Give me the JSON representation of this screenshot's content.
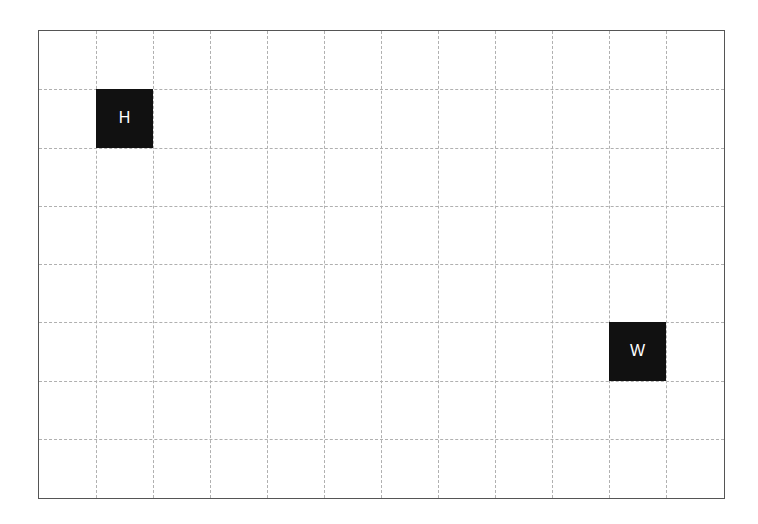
{
  "grid": {
    "columns": 12,
    "rows": 8,
    "line_color": "#b0b0b0",
    "border_color": "#555555",
    "background": "#ffffff"
  },
  "pieces": [
    {
      "label": "H",
      "col": 1,
      "row": 1,
      "color": "#111111",
      "text_color": "#ffffff"
    },
    {
      "label": "W",
      "col": 10,
      "row": 5,
      "color": "#111111",
      "text_color": "#ffffff"
    }
  ]
}
